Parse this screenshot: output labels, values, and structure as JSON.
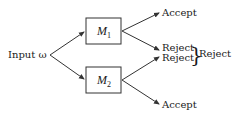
{
  "diagram": {
    "input": {
      "label": "Input ω"
    },
    "machines": [
      {
        "name": "M",
        "subscript": "1"
      },
      {
        "name": "M",
        "subscript": "2"
      }
    ],
    "outputs": {
      "m1_accept": "Accept",
      "m1_reject": "Reject",
      "m2_reject": "Reject",
      "m2_accept": "Accept",
      "combined_reject": "Reject",
      "brace": "}"
    },
    "colors": {
      "stroke": "#333333",
      "text": "#1a1a1a",
      "background": "#ffffff"
    }
  }
}
